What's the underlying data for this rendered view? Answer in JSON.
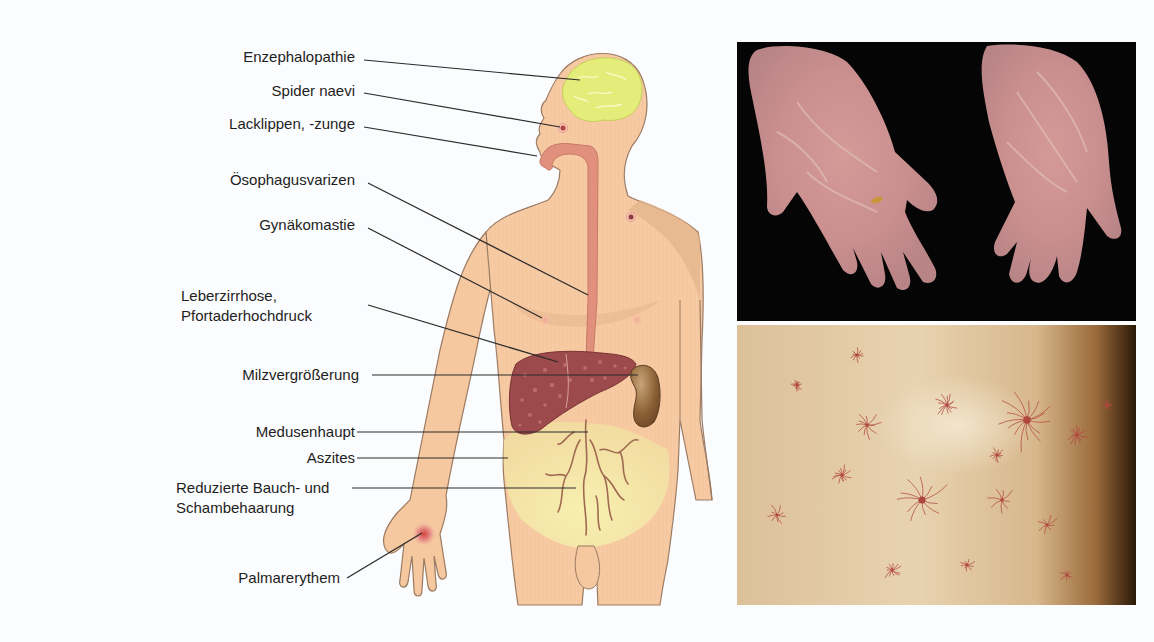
{
  "figure": {
    "title": "",
    "labels": [
      {
        "id": "enzephalopathie",
        "text": "Enzephalopathie"
      },
      {
        "id": "spider-naevi",
        "text": "Spider naevi"
      },
      {
        "id": "lacklippen",
        "text": "Lacklippen, -zunge"
      },
      {
        "id": "oesophagusvarizen",
        "text": "Ösophagusvarizen"
      },
      {
        "id": "gynaekomastie",
        "text": "Gynäkomastie"
      },
      {
        "id": "leberzirrhose",
        "text": "Leberzirrhose,",
        "text2": "Pfortaderhochdruck"
      },
      {
        "id": "milzvergroesserung",
        "text": "Milzvergrößerung"
      },
      {
        "id": "medusenhaupt",
        "text": "Medusenhaupt"
      },
      {
        "id": "aszites",
        "text": "Aszites"
      },
      {
        "id": "reduzierte-behaarung",
        "text": "Reduzierte Bauch- und",
        "text2": "Schambehaarung"
      },
      {
        "id": "palmarerythem",
        "text": "Palmarerythem"
      }
    ],
    "photos": [
      {
        "id": "palmar-erythema-photo",
        "subject": "Palmar erythema on both hands"
      },
      {
        "id": "spider-naevi-photo",
        "subject": "Spider naevi on skin"
      }
    ],
    "colors": {
      "skin": "#f6c8a0",
      "skin_shadow": "#e3b48a",
      "outline": "#9a7a62",
      "brain": "#e4ec7a",
      "esophagus": "#e2907e",
      "liver": "#9c4a4c",
      "spleen": "#8a6038",
      "ascites": "#f4eba0",
      "veins": "#a06a52",
      "leader_line": "#2a2a2a"
    }
  }
}
